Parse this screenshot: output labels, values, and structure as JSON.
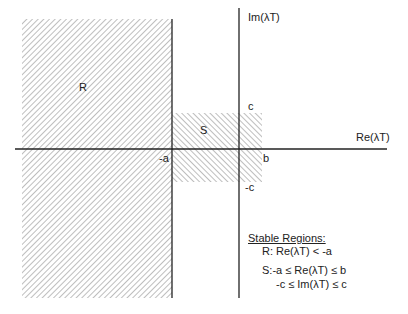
{
  "diagram": {
    "axes": {
      "x_label": "Re(λT)",
      "y_label": "Im(λT)"
    },
    "regions": [
      {
        "id": "R",
        "label": "R"
      },
      {
        "id": "S",
        "label": "S"
      }
    ],
    "tick_labels": {
      "neg_a": "-a",
      "b": "b",
      "c": "c",
      "neg_c": "-c"
    },
    "legend": {
      "title": "Stable Regions:",
      "r_line": "R:  Re(λT) < -a",
      "s_line1": "S:-a ≤ Re(λT) ≤ b",
      "s_line2": "-c ≤ Im(λT) ≤ c"
    }
  }
}
